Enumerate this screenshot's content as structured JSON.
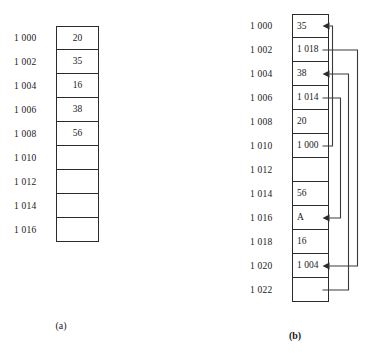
{
  "figure": {
    "panels": [
      {
        "id": "a",
        "caption": "(a)",
        "title_hidden": "",
        "rows": [
          {
            "address": "1 000",
            "value": "20"
          },
          {
            "address": "1 002",
            "value": "35"
          },
          {
            "address": "1 004",
            "value": "16"
          },
          {
            "address": "1 006",
            "value": "38"
          },
          {
            "address": "1 008",
            "value": "56"
          },
          {
            "address": "1 010",
            "value": ""
          },
          {
            "address": "1 012",
            "value": ""
          },
          {
            "address": "1 014",
            "value": ""
          },
          {
            "address": "1 016",
            "value": ""
          }
        ]
      },
      {
        "id": "b",
        "caption": "(b)",
        "rows": [
          {
            "address": "1 000",
            "value": "35"
          },
          {
            "address": "1 002",
            "value": "1 018"
          },
          {
            "address": "1 004",
            "value": "38"
          },
          {
            "address": "1 006",
            "value": "1 014"
          },
          {
            "address": "1 008",
            "value": "20"
          },
          {
            "address": "1 010",
            "value": "1 000"
          },
          {
            "address": "1 012",
            "value": ""
          },
          {
            "address": "1 014",
            "value": "56"
          },
          {
            "address": "1 016",
            "value": "A"
          },
          {
            "address": "1 018",
            "value": "16"
          },
          {
            "address": "1 020",
            "value": "1 004"
          },
          {
            "address": "1 022",
            "value": ""
          }
        ],
        "pointers": [
          {
            "from_address": "1 010",
            "to_address": "1 000",
            "value": "1 000"
          },
          {
            "from_address": "1 002",
            "to_address": "1 018",
            "value": "1 018"
          },
          {
            "from_address": "1 006",
            "to_address": "1 014",
            "value": "1 014"
          },
          {
            "from_address": "1 020",
            "to_address": "1 004",
            "value": "1 004"
          }
        ]
      }
    ]
  },
  "colors": {
    "ink": "#2b2b2b",
    "arrow": "#3a3a3a",
    "background": "#ffffff"
  }
}
